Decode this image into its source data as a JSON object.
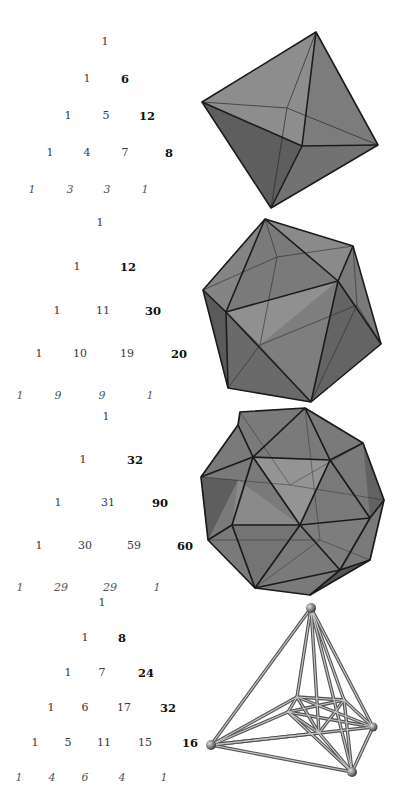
{
  "triangles": [
    {
      "name": "octahedron",
      "rows": [
        {
          "y": 42,
          "cells": [
            {
              "x": 105,
              "v": "1"
            }
          ]
        },
        {
          "y": 79,
          "cells": [
            {
              "x": 87,
              "v": "1"
            },
            {
              "x": 125,
              "v": "6",
              "bold": true
            }
          ]
        },
        {
          "y": 116,
          "cells": [
            {
              "x": 68,
              "v": "1"
            },
            {
              "x": 106,
              "v": "5"
            },
            {
              "x": 147,
              "v": "12",
              "bold": true
            }
          ]
        },
        {
          "y": 153,
          "cells": [
            {
              "x": 50,
              "v": "1"
            },
            {
              "x": 87,
              "v": "4"
            },
            {
              "x": 125,
              "v": "7"
            },
            {
              "x": 169,
              "v": "8",
              "bold": true
            }
          ]
        },
        {
          "y": 190,
          "cells": [
            {
              "x": 32,
              "v": "1",
              "italic": true
            },
            {
              "x": 70,
              "v": "3",
              "italic": true
            },
            {
              "x": 107,
              "v": "3",
              "italic": true
            },
            {
              "x": 145,
              "v": "1",
              "italic": true
            }
          ]
        }
      ]
    },
    {
      "name": "icosahedron",
      "rows": [
        {
          "y": 223,
          "cells": [
            {
              "x": 100,
              "v": "1"
            }
          ]
        },
        {
          "y": 267,
          "cells": [
            {
              "x": 77,
              "v": "1"
            },
            {
              "x": 128,
              "v": "12",
              "bold": true
            }
          ]
        },
        {
          "y": 311,
          "cells": [
            {
              "x": 57,
              "v": "1"
            },
            {
              "x": 103,
              "v": "11"
            },
            {
              "x": 153,
              "v": "30",
              "bold": true
            }
          ]
        },
        {
          "y": 354,
          "cells": [
            {
              "x": 39,
              "v": "1"
            },
            {
              "x": 80,
              "v": "10"
            },
            {
              "x": 127,
              "v": "19"
            },
            {
              "x": 179,
              "v": "20",
              "bold": true
            }
          ]
        },
        {
          "y": 396,
          "cells": [
            {
              "x": 20,
              "v": "1",
              "italic": true
            },
            {
              "x": 58,
              "v": "9",
              "italic": true
            },
            {
              "x": 102,
              "v": "9",
              "italic": true
            },
            {
              "x": 150,
              "v": "1",
              "italic": true
            }
          ]
        }
      ]
    },
    {
      "name": "geodesic-sphere",
      "rows": [
        {
          "y": 417,
          "cells": [
            {
              "x": 106,
              "v": "1"
            }
          ]
        },
        {
          "y": 460,
          "cells": [
            {
              "x": 83,
              "v": "1"
            },
            {
              "x": 135,
              "v": "32",
              "bold": true
            }
          ]
        },
        {
          "y": 503,
          "cells": [
            {
              "x": 58,
              "v": "1"
            },
            {
              "x": 108,
              "v": "31"
            },
            {
              "x": 160,
              "v": "90",
              "bold": true
            }
          ]
        },
        {
          "y": 546,
          "cells": [
            {
              "x": 39,
              "v": "1"
            },
            {
              "x": 85,
              "v": "30"
            },
            {
              "x": 134,
              "v": "59"
            },
            {
              "x": 185,
              "v": "60",
              "bold": true
            }
          ]
        },
        {
          "y": 588,
          "cells": [
            {
              "x": 20,
              "v": "1",
              "italic": true
            },
            {
              "x": 61,
              "v": "29",
              "italic": true
            },
            {
              "x": 110,
              "v": "29",
              "italic": true
            },
            {
              "x": 157,
              "v": "1",
              "italic": true
            }
          ]
        }
      ]
    },
    {
      "name": "cross-polytope-4d",
      "rows": [
        {
          "y": 603,
          "cells": [
            {
              "x": 102,
              "v": "1"
            }
          ]
        },
        {
          "y": 638,
          "cells": [
            {
              "x": 85,
              "v": "1"
            },
            {
              "x": 122,
              "v": "8",
              "bold": true
            }
          ]
        },
        {
          "y": 673,
          "cells": [
            {
              "x": 68,
              "v": "1"
            },
            {
              "x": 102,
              "v": "7"
            },
            {
              "x": 146,
              "v": "24",
              "bold": true
            }
          ]
        },
        {
          "y": 708,
          "cells": [
            {
              "x": 51,
              "v": "1"
            },
            {
              "x": 85,
              "v": "6"
            },
            {
              "x": 124,
              "v": "17"
            },
            {
              "x": 168,
              "v": "32",
              "bold": true
            }
          ]
        },
        {
          "y": 743,
          "cells": [
            {
              "x": 35,
              "v": "1"
            },
            {
              "x": 68,
              "v": "5"
            },
            {
              "x": 104,
              "v": "11"
            },
            {
              "x": 145,
              "v": "15"
            },
            {
              "x": 190,
              "v": "16",
              "bold": true
            }
          ]
        },
        {
          "y": 778,
          "cells": [
            {
              "x": 19,
              "v": "1",
              "italic": true
            },
            {
              "x": 52,
              "v": "4",
              "italic": true
            },
            {
              "x": 85,
              "v": "6",
              "italic": true
            },
            {
              "x": 122,
              "v": "4",
              "italic": true
            },
            {
              "x": 164,
              "v": "1",
              "italic": true
            }
          ]
        }
      ]
    }
  ],
  "colors": {
    "face_light": "#8a8a8a",
    "face_mid": "#6e6e6e",
    "face_dark": "#555555",
    "edge": "#1e1e1e",
    "rod": "#9a9a9a"
  }
}
